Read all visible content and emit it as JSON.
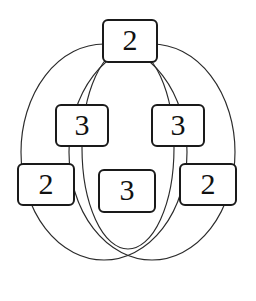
{
  "figure": {
    "type": "venn-region-graph",
    "background_color": "#ffffff",
    "stroke_color": "#1a1a1a",
    "thin_stroke_color": "#333333",
    "box_fill": "#ffffff"
  },
  "nodes": [
    {
      "id": "top",
      "label": "2",
      "position": "top-center"
    },
    {
      "id": "mid-left",
      "label": "3",
      "position": "middle-left"
    },
    {
      "id": "mid-right",
      "label": "3",
      "position": "middle-right"
    },
    {
      "id": "bot-left",
      "label": "2",
      "position": "bottom-left"
    },
    {
      "id": "bot-mid",
      "label": "3",
      "position": "bottom-center"
    },
    {
      "id": "bot-right",
      "label": "2",
      "position": "bottom-right"
    }
  ],
  "shapes": {
    "circles": [
      {
        "name": "left-circle",
        "cx": 108,
        "cy": 148,
        "rx": 87,
        "ry": 108
      },
      {
        "name": "right-circle",
        "cx": 148,
        "cy": 148,
        "rx": 87,
        "ry": 108
      },
      {
        "name": "center-oval",
        "cx": 128,
        "cy": 148,
        "rx": 46,
        "ry": 100
      }
    ]
  }
}
